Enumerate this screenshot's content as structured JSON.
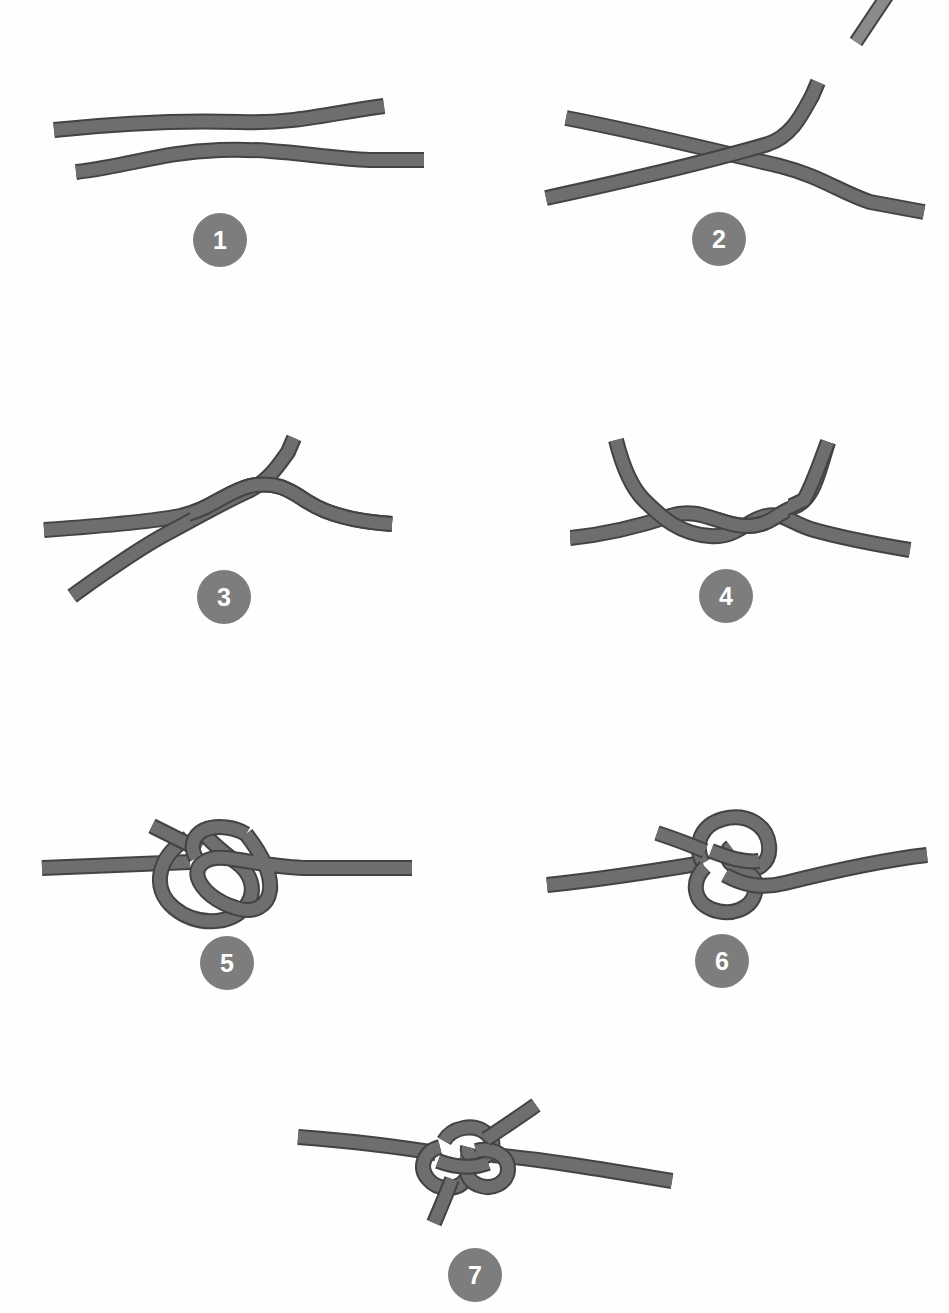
{
  "page": {
    "type": "illustrated-step-sequence",
    "background_color": "#fefefe",
    "width": 949,
    "height": 1313,
    "step_count": 7
  },
  "style": {
    "rope_fill": "#6e6e6e",
    "rope_outline": "#434343",
    "rope_thickness": 12,
    "rope_outline_width": 2,
    "badge_fill": "#7d7d7d",
    "badge_text_color": "#ffffff",
    "badge_diameter": 54,
    "badge_font_size": 25
  },
  "steps": [
    {
      "number": "1",
      "name": "two-parallel-ropes",
      "description": "Two separate rope ends laid parallel, one above the other",
      "badge_center": {
        "x": 220,
        "y": 240
      },
      "art_origin": {
        "x": 40,
        "y": 80
      }
    },
    {
      "number": "2",
      "name": "ropes-crossed",
      "description": "The two rope ends crossed over each other forming an X",
      "badge_center": {
        "x": 719,
        "y": 239
      },
      "art_origin": {
        "x": 540,
        "y": 70
      }
    },
    {
      "number": "3",
      "name": "first-twist",
      "description": "One end passed around the other making a single half twist",
      "badge_center": {
        "x": 224,
        "y": 597
      },
      "art_origin": {
        "x": 40,
        "y": 430
      }
    },
    {
      "number": "4",
      "name": "second-twist",
      "description": "A second twist added making a double overhand turn",
      "badge_center": {
        "x": 726,
        "y": 596
      },
      "art_origin": {
        "x": 570,
        "y": 430
      }
    },
    {
      "number": "5",
      "name": "loop-formed",
      "description": "A loose loop formed with the working end passing through",
      "badge_center": {
        "x": 227,
        "y": 963
      },
      "art_origin": {
        "x": 40,
        "y": 810
      }
    },
    {
      "number": "6",
      "name": "knot-tightening",
      "description": "The loop drawn closed as the knot begins to tighten",
      "badge_center": {
        "x": 722,
        "y": 961
      },
      "art_origin": {
        "x": 545,
        "y": 805
      }
    },
    {
      "number": "7",
      "name": "knot-complete",
      "description": "The finished tightened knot with both tails protruding",
      "badge_center": {
        "x": 475,
        "y": 1275
      },
      "art_origin": {
        "x": 280,
        "y": 1095
      }
    }
  ],
  "decoration": {
    "corner_fragment": {
      "name": "rope-fragment-top-right",
      "description": "A small cropped rope segment at the top right page edge"
    }
  }
}
